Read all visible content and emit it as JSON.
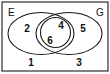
{
  "diagram": {
    "type": "venn",
    "stroke_color": "#1a1a1a",
    "background_color": "#ffffff",
    "text_color": "#111111",
    "universe": {
      "label": "E",
      "corner": "top-left"
    },
    "outer_label": {
      "label": "G",
      "corner": "top-right"
    },
    "shapes": [
      {
        "name": "frame-rectangle",
        "kind": "rect",
        "x": 2,
        "y": 2,
        "width": 106,
        "height": 69
      },
      {
        "name": "left-ellipse",
        "kind": "ellipse",
        "cx": 41,
        "cy": 33.5,
        "rx": 33,
        "ry": 21
      },
      {
        "name": "right-ellipse",
        "kind": "ellipse",
        "cx": 69,
        "cy": 33.5,
        "rx": 33,
        "ry": 21
      },
      {
        "name": "center-circle",
        "kind": "circle",
        "cx": 55.5,
        "cy": 32.5,
        "r": 15
      }
    ],
    "regions": [
      {
        "name": "region-outside-bottom-left",
        "value": "1",
        "x": 31,
        "y": 63
      },
      {
        "name": "region-left-only",
        "value": "2",
        "x": 27,
        "y": 29
      },
      {
        "name": "region-outside-bottom-right",
        "value": "3",
        "x": 79,
        "y": 63
      },
      {
        "name": "region-circle-upper",
        "value": "4",
        "x": 61,
        "y": 26
      },
      {
        "name": "region-right-only",
        "value": "5",
        "x": 83,
        "y": 29
      },
      {
        "name": "region-circle-lower",
        "value": "6",
        "x": 50,
        "y": 41
      }
    ]
  }
}
